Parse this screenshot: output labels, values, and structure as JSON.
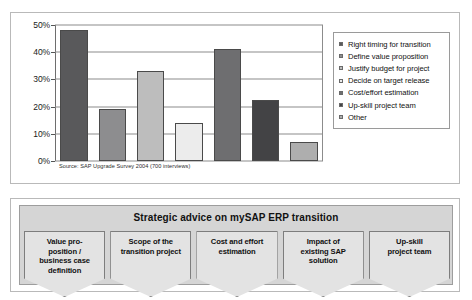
{
  "chart_data": {
    "type": "bar",
    "title": "",
    "xlabel": "",
    "ylabel": "",
    "ylim": [
      0,
      50
    ],
    "grid": true,
    "legend_position": "right",
    "ytick_labels": [
      "50%",
      "40%",
      "30%",
      "20%",
      "10%",
      "0%"
    ],
    "ytick_values": [
      50,
      40,
      30,
      20,
      10,
      0
    ],
    "categories": [
      "Right timing for transition",
      "Define value proposition",
      "Justify budget for project",
      "Decide on target release",
      "Cost/effort estimation",
      "Up-skill project team",
      "Other"
    ],
    "values": [
      48,
      19,
      33,
      14,
      41,
      22.5,
      7
    ],
    "colors": [
      "#59595b",
      "#8d8d8f",
      "#bdbdbd",
      "#ececec",
      "#6e6e70",
      "#434345",
      "#aeaeae"
    ],
    "source_note": "Source: SAP Upgrade Survey 2004 (700 interviews)"
  },
  "chart": {
    "legend": {
      "items": [
        {
          "label": "Right timing for transition",
          "color": "#59595b"
        },
        {
          "label": "Define value proposition",
          "color": "#8d8d8f"
        },
        {
          "label": "Justify budget for project",
          "color": "#bdbdbd"
        },
        {
          "label": "Decide on target release",
          "color": "#ececec"
        },
        {
          "label": "Cost/effort estimation",
          "color": "#6e6e70"
        },
        {
          "label": "Up-skill project team",
          "color": "#434345"
        },
        {
          "label": "Other",
          "color": "#aeaeae"
        }
      ]
    }
  },
  "diagram": {
    "banner_title": "Strategic advice on mySAP ERP transition",
    "steps": [
      {
        "label": "Value pro-\nposition /\nbusiness case\ndefinition"
      },
      {
        "label": "Scope of the\ntransition project"
      },
      {
        "label": "Cost and effort\nestimation"
      },
      {
        "label": "Impact of\nexisting SAP\nsolution"
      },
      {
        "label": "Up-skill\nproject team"
      }
    ]
  }
}
